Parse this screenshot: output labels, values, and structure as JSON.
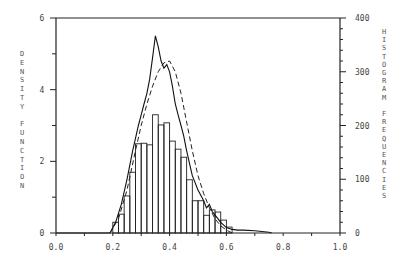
{
  "chart_data": {
    "type": "bar",
    "title": "",
    "xlabel": "",
    "ylabel_left": "DENSITY FUNCTION",
    "ylabel_right": "HISTOGRAM FREQUENCIES",
    "xlim": [
      0.0,
      1.0
    ],
    "ylim_left": [
      0,
      6
    ],
    "ylim_right": [
      0,
      400
    ],
    "x_ticks": [
      "0.0",
      "0.2",
      "0.4",
      "0.6",
      "0.8",
      "1.0"
    ],
    "y_ticks_left": [
      "0",
      "2",
      "4",
      "6"
    ],
    "y_ticks_right": [
      "0",
      "100",
      "200",
      "300",
      "400"
    ],
    "grid": false,
    "legend": null,
    "histogram": {
      "axis": "right",
      "bin_width": 0.02,
      "bin_starts": [
        0.2,
        0.22,
        0.24,
        0.26,
        0.28,
        0.3,
        0.32,
        0.34,
        0.36,
        0.38,
        0.4,
        0.42,
        0.44,
        0.46,
        0.48,
        0.5,
        0.52,
        0.54,
        0.56,
        0.58,
        0.6
      ],
      "frequencies": [
        20,
        35,
        69,
        113,
        166,
        167,
        164,
        220,
        201,
        205,
        171,
        156,
        141,
        99,
        60,
        60,
        33,
        43,
        39,
        24,
        11
      ]
    },
    "series": [
      {
        "name": "empirical density (solid)",
        "style": "solid",
        "axis": "left",
        "x": [
          0.0,
          0.19,
          0.21,
          0.23,
          0.25,
          0.27,
          0.29,
          0.3,
          0.31,
          0.32,
          0.33,
          0.34,
          0.35,
          0.36,
          0.37,
          0.38,
          0.39,
          0.4,
          0.41,
          0.42,
          0.43,
          0.44,
          0.45,
          0.46,
          0.48,
          0.5,
          0.52,
          0.53,
          0.54,
          0.55,
          0.56,
          0.57,
          0.58,
          0.6,
          0.62,
          0.64,
          0.66,
          0.7,
          0.75,
          0.76
        ],
        "y": [
          0.0,
          0.0,
          0.3,
          0.8,
          1.5,
          2.3,
          3.0,
          3.3,
          3.6,
          3.9,
          4.3,
          4.9,
          5.5,
          5.2,
          4.8,
          4.6,
          4.7,
          4.5,
          4.1,
          3.6,
          3.3,
          3.0,
          2.7,
          2.3,
          1.6,
          1.2,
          0.9,
          0.7,
          0.8,
          0.6,
          0.5,
          0.4,
          0.3,
          0.15,
          0.1,
          0.08,
          0.08,
          0.06,
          0.02,
          0.0
        ]
      },
      {
        "name": "fitted density (dashed)",
        "style": "dashed",
        "axis": "left",
        "x": [
          0.19,
          0.22,
          0.25,
          0.28,
          0.3,
          0.32,
          0.34,
          0.36,
          0.38,
          0.4,
          0.42,
          0.44,
          0.46,
          0.48,
          0.5,
          0.52,
          0.54,
          0.56,
          0.58,
          0.6,
          0.62
        ],
        "y": [
          0.0,
          0.4,
          1.2,
          2.3,
          3.0,
          3.6,
          4.1,
          4.5,
          4.75,
          4.8,
          4.5,
          3.9,
          3.1,
          2.3,
          1.6,
          1.1,
          0.7,
          0.4,
          0.2,
          0.08,
          0.0
        ]
      }
    ]
  }
}
